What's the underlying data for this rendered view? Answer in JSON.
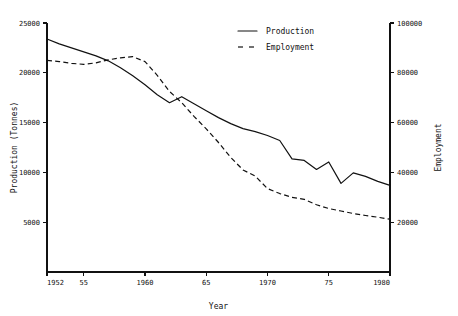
{
  "chart_data": {
    "type": "line",
    "title": "",
    "subtitle": "",
    "xlabel": "Year",
    "ylabel": "Production (Tonnes)",
    "ylabel_right": "Employment",
    "grid": false,
    "legend_position": "top-center",
    "xlim": [
      1952,
      1980
    ],
    "ylim": [
      0,
      25000
    ],
    "ylim_right": [
      0,
      100000
    ],
    "x": [
      1952,
      1953,
      1954,
      1955,
      1956,
      1957,
      1958,
      1959,
      1960,
      1961,
      1962,
      1963,
      1964,
      1965,
      1966,
      1967,
      1968,
      1969,
      1970,
      1971,
      1972,
      1973,
      1974,
      1975,
      1976,
      1977,
      1978,
      1979,
      1980
    ],
    "xticks": [
      1952,
      1955,
      1960,
      1965,
      1970,
      1975,
      1980
    ],
    "xticklabels": [
      "1952",
      "55",
      "1960",
      "65",
      "1970",
      "75",
      "1980"
    ],
    "yticks": [
      5000,
      10000,
      15000,
      20000,
      25000
    ],
    "yticklabels": [
      "5000",
      "10000",
      "15000",
      "20000",
      "25000"
    ],
    "yticks_right": [
      20000,
      40000,
      60000,
      80000,
      100000
    ],
    "yticklabels_right": [
      "20000",
      "40000",
      "60000",
      "80000",
      "100000"
    ],
    "series": [
      {
        "name": "Production",
        "axis": "left",
        "style": "solid",
        "color": "#111111",
        "values": [
          23400,
          22900,
          22500,
          22100,
          21700,
          21200,
          20500,
          19700,
          18800,
          17800,
          17000,
          17600,
          16900,
          16200,
          15500,
          14900,
          14400,
          14100,
          13700,
          13200,
          11350,
          11200,
          10300,
          11050,
          8900,
          9950,
          9600,
          9100,
          8700
        ]
      },
      {
        "name": "Employment",
        "axis": "right",
        "style": "dashed",
        "color": "#111111",
        "values": [
          85000,
          84500,
          83800,
          83400,
          84000,
          85200,
          86000,
          86500,
          84500,
          79000,
          72500,
          68000,
          62500,
          57500,
          52000,
          46000,
          41000,
          38500,
          33500,
          31500,
          30000,
          29200,
          27000,
          25500,
          24500,
          23500,
          22700,
          22000,
          21200
        ]
      }
    ],
    "annotations": []
  },
  "legend": {
    "items": [
      {
        "label": "Production",
        "style": "solid"
      },
      {
        "label": "Employment",
        "style": "dashed"
      }
    ]
  }
}
